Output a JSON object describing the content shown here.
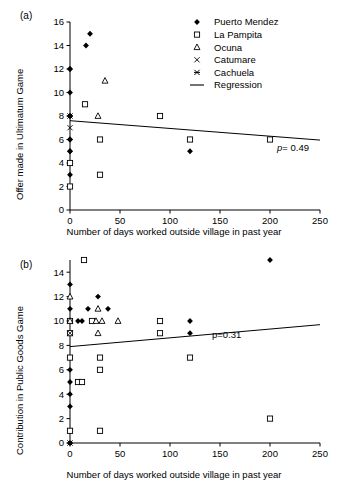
{
  "figure": {
    "panels": [
      {
        "label": "(a)",
        "xlabel": "Number of days worked outside village in past year",
        "ylabel": "Offer made in Ultimatum Game",
        "pvalue_label": "p",
        "pvalue_eq": "= 0.49"
      },
      {
        "label": "(b)",
        "xlabel": "Number of days worked outside village in past year",
        "ylabel": "Contribution in Public Goods Game",
        "pvalue_label": "p",
        "pvalue_eq": "=0.31"
      }
    ],
    "legend": {
      "items": [
        {
          "label": "Puerto Mendez",
          "marker": "filled-diamond-icon"
        },
        {
          "label": "La Pampita",
          "marker": "open-square-icon"
        },
        {
          "label": "Ocuna",
          "marker": "open-triangle-icon"
        },
        {
          "label": "Catumare",
          "marker": "cross-x-icon"
        },
        {
          "label": "Cachuela",
          "marker": "star-x-icon"
        },
        {
          "label": "Regression",
          "marker": "line-icon"
        }
      ]
    }
  },
  "chart_data": [
    {
      "type": "scatter",
      "panel": "(a)",
      "title": "",
      "xlabel": "Number of days worked outside village in past year",
      "ylabel": "Offer made in Ultimatum Game",
      "xlim": [
        0,
        250
      ],
      "ylim": [
        0,
        16
      ],
      "xticks": [
        0,
        50,
        100,
        150,
        200,
        250
      ],
      "yticks": [
        0,
        2,
        4,
        6,
        8,
        10,
        12,
        14,
        16
      ],
      "grid": false,
      "legend_position": "top-right",
      "annotations": [
        {
          "text": "p = 0.49",
          "x": 215,
          "y": 5.6
        }
      ],
      "regression": {
        "x": [
          0,
          250
        ],
        "y": [
          7.6,
          5.95
        ]
      },
      "series": [
        {
          "name": "Puerto Mendez",
          "marker": "filled-diamond",
          "points": [
            [
              20,
              15
            ],
            [
              16,
              14
            ],
            [
              0,
              12
            ],
            [
              0,
              12
            ],
            [
              0,
              10
            ],
            [
              0,
              8
            ],
            [
              0,
              8
            ],
            [
              0,
              6
            ],
            [
              0,
              6
            ],
            [
              0,
              5
            ],
            [
              0,
              5
            ],
            [
              0,
              3
            ],
            [
              120,
              5
            ]
          ]
        },
        {
          "name": "La Pampita",
          "marker": "open-square",
          "points": [
            [
              15,
              9
            ],
            [
              30,
              6
            ],
            [
              30,
              3
            ],
            [
              0,
              4
            ],
            [
              0,
              2
            ],
            [
              90,
              8
            ],
            [
              120,
              6
            ],
            [
              200,
              6
            ]
          ]
        },
        {
          "name": "Ocuna",
          "marker": "open-triangle",
          "points": [
            [
              35,
              11
            ],
            [
              28,
              8
            ]
          ]
        },
        {
          "name": "Catumare",
          "marker": "cross-x",
          "points": [
            [
              0,
              7
            ]
          ]
        },
        {
          "name": "Cachuela",
          "marker": "star-x",
          "points": [
            [
              0,
              8
            ]
          ]
        }
      ]
    },
    {
      "type": "scatter",
      "panel": "(b)",
      "title": "",
      "xlabel": "Number of days worked outside village in past year",
      "ylabel": "Contribution in Public Goods Game",
      "xlim": [
        0,
        250
      ],
      "ylim": [
        0,
        15
      ],
      "xticks": [
        0,
        50,
        100,
        150,
        200,
        250
      ],
      "yticks": [
        0,
        2,
        4,
        6,
        8,
        10,
        12,
        14
      ],
      "grid": false,
      "legend_position": "none",
      "annotations": [
        {
          "text": "p=0.31",
          "x": 148,
          "y": 8.0
        }
      ],
      "regression": {
        "x": [
          0,
          250
        ],
        "y": [
          7.9,
          9.7
        ]
      },
      "series": [
        {
          "name": "Puerto Mendez",
          "marker": "filled-diamond",
          "points": [
            [
              200,
              15
            ],
            [
              0,
              13
            ],
            [
              28,
              12
            ],
            [
              18,
              11
            ],
            [
              38,
              11
            ],
            [
              0,
              11
            ],
            [
              0,
              10
            ],
            [
              8,
              10
            ],
            [
              12,
              10
            ],
            [
              0,
              9
            ],
            [
              0,
              7
            ],
            [
              0,
              7
            ],
            [
              0,
              6
            ],
            [
              0,
              5
            ],
            [
              0,
              4
            ],
            [
              0,
              3
            ],
            [
              0,
              1
            ],
            [
              0,
              0
            ],
            [
              120,
              10
            ],
            [
              120,
              9
            ]
          ]
        },
        {
          "name": "La Pampita",
          "marker": "open-square",
          "points": [
            [
              14,
              15
            ],
            [
              0,
              10
            ],
            [
              22,
              10
            ],
            [
              0,
              9
            ],
            [
              0,
              7
            ],
            [
              30,
              7
            ],
            [
              30,
              6
            ],
            [
              8,
              5
            ],
            [
              12,
              5
            ],
            [
              0,
              1
            ],
            [
              30,
              1
            ],
            [
              90,
              10
            ],
            [
              90,
              9
            ],
            [
              120,
              7
            ],
            [
              200,
              2
            ]
          ]
        },
        {
          "name": "Ocuna",
          "marker": "open-triangle",
          "points": [
            [
              0,
              12
            ],
            [
              28,
              11
            ],
            [
              26,
              10
            ],
            [
              32,
              10
            ],
            [
              48,
              10
            ],
            [
              28,
              9
            ],
            [
              0,
              10
            ]
          ]
        },
        {
          "name": "Catumare",
          "marker": "cross-x",
          "points": [
            [
              0,
              9
            ]
          ]
        },
        {
          "name": "Cachuela",
          "marker": "star-x",
          "points": [
            [
              0,
              0
            ]
          ]
        }
      ]
    }
  ]
}
